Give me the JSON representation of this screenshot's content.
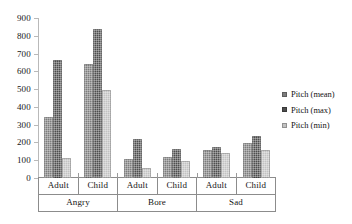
{
  "chart_data": {
    "type": "bar",
    "title": "",
    "xlabel": "",
    "ylabel": "",
    "ylim": [
      0,
      900
    ],
    "ytick_step": 100,
    "yticks": [
      900,
      800,
      700,
      600,
      500,
      400,
      300,
      200,
      100,
      0
    ],
    "grid": false,
    "legend_position": "right",
    "categories": [
      "Adult",
      "Child",
      "Adult",
      "Child",
      "Adult",
      "Child"
    ],
    "group_labels": [
      "Angry",
      "Bore",
      "Sad"
    ],
    "series": [
      {
        "name": "Pitch (mean)",
        "color": "#7d7d7d",
        "values": [
          345,
          640,
          108,
          120,
          155,
          195
        ]
      },
      {
        "name": "Pitch (max)",
        "color": "#4d4d4d",
        "values": [
          665,
          840,
          222,
          162,
          175,
          235
        ]
      },
      {
        "name": "Pitch (min)",
        "color": "#c2c2c2",
        "values": [
          112,
          495,
          55,
          95,
          140,
          155
        ]
      }
    ]
  },
  "legend": {
    "items": [
      {
        "label": "Pitch (mean)",
        "swatch": "legend-swatch-mean"
      },
      {
        "label": "Pitch (max)",
        "swatch": "legend-swatch-max"
      },
      {
        "label": "Pitch (min)",
        "swatch": "legend-swatch-min"
      }
    ]
  },
  "axis": {
    "y_tick_labels": [
      "900",
      "800",
      "700",
      "600",
      "500",
      "400",
      "300",
      "200",
      "100",
      "0"
    ]
  },
  "x_axis_table": {
    "row_age": [
      "Adult",
      "Child",
      "Adult",
      "Child",
      "Adult",
      "Child"
    ],
    "row_emotion": [
      "Angry",
      "Bore",
      "Sad"
    ]
  }
}
